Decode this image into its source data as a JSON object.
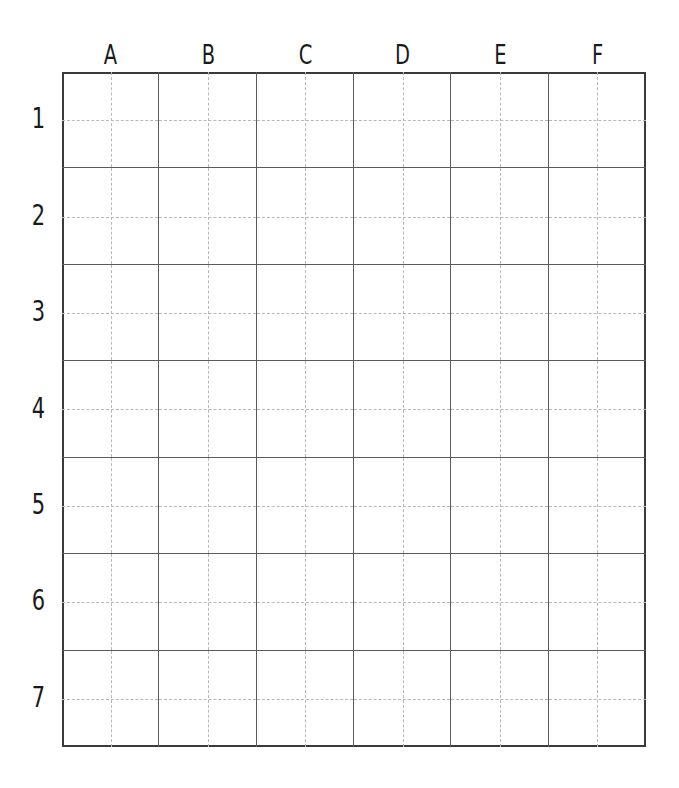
{
  "worksheet": {
    "columns": [
      "A",
      "B",
      "C",
      "D",
      "E",
      "F"
    ],
    "rows": [
      "1",
      "2",
      "3",
      "4",
      "5",
      "6",
      "7"
    ],
    "colors": {
      "line": "#5a5a5a",
      "border": "#3a3a3a",
      "guide": "#b8b8b8",
      "text": "#1a1a1a"
    }
  }
}
